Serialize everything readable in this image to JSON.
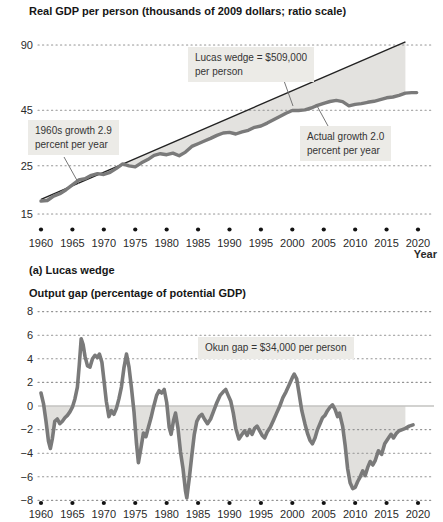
{
  "captions": {
    "panel_a": "(a) Lucas wedge"
  },
  "style": {
    "line_gray": "#7a7a7a",
    "trend_black": "#222222",
    "wedge_fill": "#e3e2df",
    "gap_fill": "#e1e0dd",
    "grid_dot": "#949494",
    "zero_line": "#c3c3c0",
    "tick_dot": "#131313",
    "label_bg": "#ECEBE7",
    "text": "#2a2a2a",
    "callout_line": "#767676"
  },
  "chart_data": [
    {
      "id": "lucas-wedge-panel",
      "type": "line",
      "title": "Real GDP per person (thousands of 2009 dollars; ratio scale)",
      "xlabel": "Year",
      "yscale": "log",
      "yticks": [
        90,
        45,
        25,
        15
      ],
      "xticks": [
        1960,
        1965,
        1970,
        1975,
        1980,
        1985,
        1990,
        1995,
        2000,
        2005,
        2010,
        2015,
        2020
      ],
      "xlim": [
        1958.5,
        2022.5
      ],
      "wedge_end_year": 2018,
      "annotations": {
        "sixties": {
          "line1": "1960s growth 2.9",
          "line2": "percent per year"
        },
        "lucas": {
          "line1": "Lucas wedge = $509,000",
          "line2": "per person"
        },
        "actual": {
          "line1": "Actual growth 2.0",
          "line2": "percent per year"
        }
      },
      "series": [
        {
          "name": "1960s growth trend",
          "growth_rate_percent_per_year": 2.9,
          "x": [
            1960,
            2018
          ],
          "values": [
            17.5,
            93
          ]
        },
        {
          "name": "Actual real GDP per person",
          "growth_rate_percent_per_year": 2.0,
          "points": [
            [
              1960,
              17.2
            ],
            [
              1961,
              17.3
            ],
            [
              1962,
              18.1
            ],
            [
              1963,
              18.6
            ],
            [
              1964,
              19.4
            ],
            [
              1965,
              20.4
            ],
            [
              1966,
              21.5
            ],
            [
              1967,
              21.8
            ],
            [
              1968,
              22.6
            ],
            [
              1969,
              23.0
            ],
            [
              1970,
              22.8
            ],
            [
              1971,
              23.3
            ],
            [
              1972,
              24.3
            ],
            [
              1973,
              25.5
            ],
            [
              1974,
              25.0
            ],
            [
              1975,
              24.7
            ],
            [
              1976,
              25.8
            ],
            [
              1977,
              26.7
            ],
            [
              1978,
              27.9
            ],
            [
              1979,
              28.4
            ],
            [
              1980,
              28.1
            ],
            [
              1981,
              28.6
            ],
            [
              1982,
              27.8
            ],
            [
              1983,
              28.9
            ],
            [
              1984,
              30.7
            ],
            [
              1985,
              31.6
            ],
            [
              1986,
              32.5
            ],
            [
              1987,
              33.4
            ],
            [
              1988,
              34.5
            ],
            [
              1989,
              35.4
            ],
            [
              1990,
              35.6
            ],
            [
              1991,
              35.0
            ],
            [
              1992,
              35.8
            ],
            [
              1993,
              36.4
            ],
            [
              1994,
              37.6
            ],
            [
              1995,
              38.1
            ],
            [
              1996,
              39.3
            ],
            [
              1997,
              40.7
            ],
            [
              1998,
              42.1
            ],
            [
              1999,
              43.6
            ],
            [
              2000,
              44.9
            ],
            [
              2001,
              44.9
            ],
            [
              2002,
              45.2
            ],
            [
              2003,
              46.1
            ],
            [
              2004,
              47.4
            ],
            [
              2005,
              48.5
            ],
            [
              2006,
              49.4
            ],
            [
              2007,
              50.0
            ],
            [
              2008,
              49.3
            ],
            [
              2009,
              47.2
            ],
            [
              2010,
              47.9
            ],
            [
              2011,
              48.3
            ],
            [
              2012,
              49.0
            ],
            [
              2013,
              49.5
            ],
            [
              2014,
              50.4
            ],
            [
              2015,
              51.4
            ],
            [
              2016,
              51.8
            ],
            [
              2017,
              52.7
            ],
            [
              2018,
              54.0
            ],
            [
              2019,
              54.3
            ],
            [
              2019.8,
              54.3
            ]
          ]
        }
      ]
    },
    {
      "id": "okun-gap-panel",
      "type": "line",
      "title": "Output gap (percentage of potential GDP)",
      "xlabel": "",
      "yscale": "linear",
      "ylim": [
        -8,
        8
      ],
      "yticks": [
        8,
        6,
        4,
        2,
        0,
        -2,
        -4,
        -6,
        -8
      ],
      "xticks": [
        1960,
        1965,
        1970,
        1975,
        1980,
        1985,
        1990,
        1995,
        2000,
        2005,
        2010,
        2015,
        2020
      ],
      "xlim": [
        1958.5,
        2022.5
      ],
      "shade_end_year": 2018,
      "annotations": {
        "okun": {
          "text": "Okun gap = $34,000 per person"
        }
      },
      "series": [
        {
          "name": "Output gap",
          "points": [
            [
              1960.0,
              1.1
            ],
            [
              1960.4,
              0.2
            ],
            [
              1960.8,
              -1.3
            ],
            [
              1961.2,
              -3.0
            ],
            [
              1961.5,
              -3.6
            ],
            [
              1961.8,
              -2.8
            ],
            [
              1962.2,
              -1.3
            ],
            [
              1962.6,
              -1.1
            ],
            [
              1963.0,
              -1.5
            ],
            [
              1963.4,
              -1.3
            ],
            [
              1963.8,
              -1.0
            ],
            [
              1964.2,
              -0.8
            ],
            [
              1964.6,
              -0.5
            ],
            [
              1965.0,
              -0.1
            ],
            [
              1965.4,
              0.6
            ],
            [
              1965.8,
              1.6
            ],
            [
              1966.1,
              3.5
            ],
            [
              1966.4,
              5.7
            ],
            [
              1966.7,
              5.2
            ],
            [
              1967.0,
              4.2
            ],
            [
              1967.4,
              3.4
            ],
            [
              1967.8,
              3.3
            ],
            [
              1968.2,
              4.0
            ],
            [
              1968.6,
              4.3
            ],
            [
              1969.0,
              4.1
            ],
            [
              1969.3,
              4.4
            ],
            [
              1969.7,
              3.7
            ],
            [
              1970.0,
              2.3
            ],
            [
              1970.4,
              0.4
            ],
            [
              1970.8,
              -0.9
            ],
            [
              1971.2,
              -0.4
            ],
            [
              1971.6,
              -0.7
            ],
            [
              1972.0,
              -0.2
            ],
            [
              1972.4,
              0.6
            ],
            [
              1972.8,
              1.6
            ],
            [
              1973.2,
              3.2
            ],
            [
              1973.6,
              4.4
            ],
            [
              1974.0,
              3.3
            ],
            [
              1974.4,
              1.5
            ],
            [
              1974.8,
              -0.5
            ],
            [
              1975.2,
              -3.2
            ],
            [
              1975.5,
              -4.8
            ],
            [
              1975.9,
              -3.6
            ],
            [
              1976.3,
              -2.3
            ],
            [
              1976.7,
              -2.6
            ],
            [
              1977.1,
              -1.8
            ],
            [
              1977.5,
              -1.0
            ],
            [
              1977.9,
              -0.1
            ],
            [
              1978.4,
              0.9
            ],
            [
              1978.8,
              1.3
            ],
            [
              1979.2,
              1.1
            ],
            [
              1979.6,
              1.4
            ],
            [
              1980.0,
              0.3
            ],
            [
              1980.4,
              -1.8
            ],
            [
              1980.7,
              -2.4
            ],
            [
              1981.1,
              -1.2
            ],
            [
              1981.4,
              -0.6
            ],
            [
              1981.8,
              -1.9
            ],
            [
              1982.2,
              -3.9
            ],
            [
              1982.6,
              -5.3
            ],
            [
              1983.0,
              -7.2
            ],
            [
              1983.2,
              -7.8
            ],
            [
              1983.6,
              -6.1
            ],
            [
              1984.0,
              -4.2
            ],
            [
              1984.4,
              -2.4
            ],
            [
              1984.8,
              -1.3
            ],
            [
              1985.2,
              -0.9
            ],
            [
              1985.6,
              -0.7
            ],
            [
              1986.0,
              -1.1
            ],
            [
              1986.5,
              -1.5
            ],
            [
              1987.0,
              -1.1
            ],
            [
              1987.5,
              -0.4
            ],
            [
              1988.0,
              0.3
            ],
            [
              1988.5,
              0.9
            ],
            [
              1989.0,
              1.2
            ],
            [
              1989.4,
              1.4
            ],
            [
              1989.8,
              0.9
            ],
            [
              1990.2,
              0.4
            ],
            [
              1990.6,
              -0.6
            ],
            [
              1991.0,
              -1.9
            ],
            [
              1991.5,
              -2.8
            ],
            [
              1992.0,
              -2.4
            ],
            [
              1992.4,
              -2.1
            ],
            [
              1992.8,
              -2.5
            ],
            [
              1993.2,
              -2.0
            ],
            [
              1993.6,
              -2.4
            ],
            [
              1994.0,
              -1.9
            ],
            [
              1994.4,
              -1.7
            ],
            [
              1994.8,
              -2.1
            ],
            [
              1995.2,
              -2.5
            ],
            [
              1995.6,
              -2.7
            ],
            [
              1996.0,
              -2.2
            ],
            [
              1996.5,
              -1.8
            ],
            [
              1997.0,
              -1.2
            ],
            [
              1997.5,
              -0.6
            ],
            [
              1998.0,
              0.0
            ],
            [
              1998.5,
              0.7
            ],
            [
              1999.0,
              1.2
            ],
            [
              1999.5,
              1.8
            ],
            [
              2000.0,
              2.4
            ],
            [
              2000.3,
              2.7
            ],
            [
              2000.7,
              2.3
            ],
            [
              2001.1,
              1.0
            ],
            [
              2001.5,
              -0.4
            ],
            [
              2002.0,
              -1.5
            ],
            [
              2002.4,
              -2.3
            ],
            [
              2002.8,
              -2.9
            ],
            [
              2003.2,
              -3.2
            ],
            [
              2003.6,
              -2.7
            ],
            [
              2004.0,
              -2.0
            ],
            [
              2004.4,
              -1.5
            ],
            [
              2004.8,
              -1.0
            ],
            [
              2005.2,
              -0.8
            ],
            [
              2005.6,
              -0.4
            ],
            [
              2006.0,
              -0.1
            ],
            [
              2006.4,
              0.1
            ],
            [
              2006.8,
              -0.3
            ],
            [
              2007.2,
              -0.9
            ],
            [
              2007.5,
              -0.6
            ],
            [
              2008.0,
              -1.7
            ],
            [
              2008.4,
              -3.3
            ],
            [
              2008.8,
              -5.3
            ],
            [
              2009.2,
              -6.5
            ],
            [
              2009.6,
              -7.0
            ],
            [
              2010.0,
              -6.9
            ],
            [
              2010.4,
              -6.4
            ],
            [
              2010.8,
              -6.0
            ],
            [
              2011.2,
              -5.5
            ],
            [
              2011.6,
              -5.9
            ],
            [
              2012.0,
              -5.2
            ],
            [
              2012.4,
              -4.7
            ],
            [
              2012.8,
              -5.0
            ],
            [
              2013.2,
              -4.6
            ],
            [
              2013.7,
              -3.8
            ],
            [
              2014.2,
              -4.1
            ],
            [
              2014.7,
              -3.2
            ],
            [
              2015.2,
              -2.8
            ],
            [
              2015.7,
              -2.4
            ],
            [
              2016.1,
              -2.7
            ],
            [
              2016.6,
              -2.3
            ],
            [
              2017.0,
              -2.1
            ],
            [
              2017.5,
              -2.0
            ],
            [
              2018.0,
              -1.9
            ],
            [
              2018.6,
              -1.7
            ],
            [
              2019.2,
              -1.6
            ]
          ]
        }
      ]
    }
  ]
}
